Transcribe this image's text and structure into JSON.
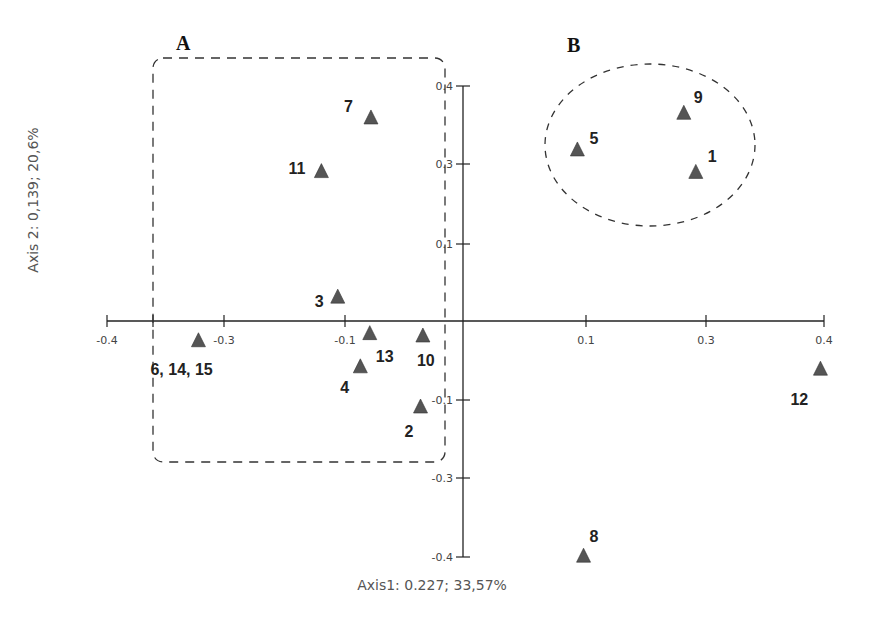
{
  "chart_data": {
    "type": "scatter",
    "title": "",
    "xlabel": "Axis1: 0.227; 33,57%",
    "ylabel": "Axis 2: 0,139; 20,6%",
    "xlim": [
      -0.4,
      0.4
    ],
    "ylim": [
      -0.4,
      0.4
    ],
    "grid": false,
    "marker": "triangle",
    "marker_color": "#555555",
    "x_ticks": [
      {
        "value": -0.4,
        "label": "-0.4"
      },
      {
        "value": -0.35,
        "label": ""
      },
      {
        "value": -0.3,
        "label": "-0.3"
      },
      {
        "value": -0.1,
        "label": "-0.1"
      },
      {
        "value": 0.1,
        "label": "0.1"
      },
      {
        "value": 0.3,
        "label": "0.3"
      },
      {
        "value": 0.4,
        "label": "0.4"
      }
    ],
    "y_ticks": [
      {
        "value": 0.4,
        "label": "0.4"
      },
      {
        "value": 0.3,
        "label": "0.3"
      },
      {
        "value": 0.1,
        "label": "0.1"
      },
      {
        "value": -0.1,
        "label": "-0.1"
      },
      {
        "value": -0.3,
        "label": "-0.3"
      },
      {
        "value": -0.4,
        "label": "-0.4"
      }
    ],
    "points": [
      {
        "label": "9",
        "x": 0.263,
        "y": 0.365
      },
      {
        "label": "5",
        "x": 0.093,
        "y": 0.318
      },
      {
        "label": "1",
        "x": 0.283,
        "y": 0.279
      },
      {
        "label": "7",
        "x": -0.078,
        "y": 0.359
      },
      {
        "label": "11",
        "x": -0.139,
        "y": 0.281
      },
      {
        "label": "3",
        "x": -0.112,
        "y": 0.031
      },
      {
        "label": "6, 14, 15",
        "x": -0.318,
        "y": -0.025
      },
      {
        "label": "13",
        "x": -0.079,
        "y": -0.016
      },
      {
        "label": "10",
        "x": -0.034,
        "y": -0.019
      },
      {
        "label": "4",
        "x": -0.087,
        "y": -0.058
      },
      {
        "label": "2",
        "x": -0.036,
        "y": -0.118
      },
      {
        "label": "12",
        "x": 0.397,
        "y": -0.061
      },
      {
        "label": "8",
        "x": 0.098,
        "y": -0.399
      }
    ],
    "annotations": [
      {
        "label": "A",
        "shape": "dashed-rounded-rectangle",
        "members": [
          "7",
          "11",
          "3",
          "6, 14, 15",
          "13",
          "10",
          "4",
          "2"
        ]
      },
      {
        "label": "B",
        "shape": "dashed-circle",
        "members": [
          "9",
          "5",
          "1"
        ]
      }
    ]
  }
}
